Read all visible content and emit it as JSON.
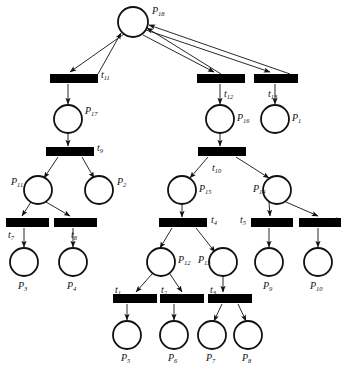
{
  "diagram": {
    "type": "petri-net",
    "title": "",
    "places": [
      {
        "id": "P18",
        "label": "P",
        "sub": "18",
        "cx": 133,
        "cy": 22,
        "r": 15,
        "label_x": 152,
        "label_y": 6
      },
      {
        "id": "P17",
        "label": "P",
        "sub": "17",
        "cx": 68,
        "cy": 119,
        "r": 14,
        "label_x": 85,
        "label_y": 106
      },
      {
        "id": "P16",
        "label": "P",
        "sub": "16",
        "cx": 220,
        "cy": 119,
        "r": 14,
        "label_x": 237,
        "label_y": 113
      },
      {
        "id": "P1",
        "label": "P",
        "sub": "1",
        "cx": 275,
        "cy": 119,
        "r": 14,
        "label_x": 292,
        "label_y": 113
      },
      {
        "id": "P11",
        "label": "P",
        "sub": "11",
        "cx": 38,
        "cy": 190,
        "r": 14,
        "label_x": 11,
        "label_y": 177
      },
      {
        "id": "P2",
        "label": "P",
        "sub": "2",
        "cx": 99,
        "cy": 190,
        "r": 14,
        "label_x": 117,
        "label_y": 177
      },
      {
        "id": "P15",
        "label": "P",
        "sub": "15",
        "cx": 182,
        "cy": 190,
        "r": 14,
        "label_x": 199,
        "label_y": 184
      },
      {
        "id": "P14",
        "label": "P",
        "sub": "14",
        "cx": 277,
        "cy": 190,
        "r": 14,
        "label_x": 253,
        "label_y": 184
      },
      {
        "id": "P3",
        "label": "P",
        "sub": "3",
        "cx": 24,
        "cy": 262,
        "r": 14,
        "label_x": 18,
        "label_y": 281
      },
      {
        "id": "P4",
        "label": "P",
        "sub": "4",
        "cx": 73,
        "cy": 262,
        "r": 14,
        "label_x": 67,
        "label_y": 281
      },
      {
        "id": "P12",
        "label": "P",
        "sub": "12",
        "cx": 161,
        "cy": 262,
        "r": 14,
        "label_x": 178,
        "label_y": 255
      },
      {
        "id": "P13",
        "label": "P",
        "sub": "13",
        "cx": 223,
        "cy": 262,
        "r": 14,
        "label_x": 198,
        "label_y": 255
      },
      {
        "id": "P9",
        "label": "P",
        "sub": "9",
        "cx": 269,
        "cy": 262,
        "r": 14,
        "label_x": 263,
        "label_y": 281
      },
      {
        "id": "P10",
        "label": "P",
        "sub": "10",
        "cx": 318,
        "cy": 262,
        "r": 14,
        "label_x": 310,
        "label_y": 281
      },
      {
        "id": "P5",
        "label": "P",
        "sub": "5",
        "cx": 127,
        "cy": 335,
        "r": 14,
        "label_x": 121,
        "label_y": 353
      },
      {
        "id": "P6",
        "label": "P",
        "sub": "6",
        "cx": 174,
        "cy": 335,
        "r": 14,
        "label_x": 168,
        "label_y": 353
      },
      {
        "id": "P7",
        "label": "P",
        "sub": "7",
        "cx": 212,
        "cy": 335,
        "r": 14,
        "label_x": 206,
        "label_y": 353
      },
      {
        "id": "P8",
        "label": "P",
        "sub": "8",
        "cx": 248,
        "cy": 335,
        "r": 14,
        "label_x": 242,
        "label_y": 353
      }
    ],
    "transitions": [
      {
        "id": "t11",
        "label": "t",
        "sub": "11",
        "x": 50,
        "y": 74,
        "w": 48,
        "h": 9,
        "label_x": 101,
        "label_y": 70
      },
      {
        "id": "t12",
        "label": "t",
        "sub": "12",
        "x": 197,
        "y": 74,
        "w": 48,
        "h": 9,
        "label_x": 224,
        "label_y": 89
      },
      {
        "id": "t13",
        "label": "t",
        "sub": "13",
        "x": 254,
        "y": 74,
        "w": 44,
        "h": 9,
        "label_x": 268,
        "label_y": 89
      },
      {
        "id": "t9",
        "label": "t",
        "sub": "9",
        "x": 46,
        "y": 147,
        "w": 48,
        "h": 9,
        "label_x": 97,
        "label_y": 143
      },
      {
        "id": "t10",
        "label": "t",
        "sub": "10",
        "x": 198,
        "y": 147,
        "w": 48,
        "h": 9,
        "label_x": 212,
        "label_y": 163
      },
      {
        "id": "t7",
        "label": "t",
        "sub": "7",
        "x": 6,
        "y": 218,
        "w": 43,
        "h": 9,
        "label_x": 8,
        "label_y": 230
      },
      {
        "id": "t8",
        "label": "t",
        "sub": "8",
        "x": 54,
        "y": 218,
        "w": 43,
        "h": 9,
        "label_x": 71,
        "label_y": 230
      },
      {
        "id": "t4",
        "label": "t",
        "sub": "4",
        "x": 159,
        "y": 218,
        "w": 48,
        "h": 9,
        "label_x": 211,
        "label_y": 215
      },
      {
        "id": "t5",
        "label": "t",
        "sub": "5",
        "x": 251,
        "y": 218,
        "w": 42,
        "h": 9,
        "label_x": 240,
        "label_y": 215
      },
      {
        "id": "t6",
        "label": "t",
        "sub": "6",
        "x": 299,
        "y": 218,
        "w": 42,
        "h": 9,
        "label_x": 335,
        "label_y": 215
      },
      {
        "id": "t1",
        "label": "t",
        "sub": "1",
        "x": 113,
        "y": 294,
        "w": 44,
        "h": 9,
        "label_x": 115,
        "label_y": 285
      },
      {
        "id": "t2",
        "label": "t",
        "sub": "2",
        "x": 160,
        "y": 294,
        "w": 44,
        "h": 9,
        "label_x": 161,
        "label_y": 285
      },
      {
        "id": "t3",
        "label": "t",
        "sub": "3",
        "x": 208,
        "y": 294,
        "w": 44,
        "h": 9,
        "label_x": 210,
        "label_y": 285
      }
    ],
    "arcs": [
      {
        "from": "t11",
        "to": "P18",
        "x1": 98,
        "y1": 74,
        "x2": 121,
        "y2": 33
      },
      {
        "from": "t12",
        "to": "P18",
        "x1": 221,
        "y1": 74,
        "x2": 147,
        "y2": 28
      },
      {
        "from": "t13",
        "to": "P18",
        "x1": 290,
        "y1": 74,
        "x2": 149,
        "y2": 25
      },
      {
        "from": "P18",
        "to": "t11",
        "x1": 124,
        "y1": 34,
        "x2": 70,
        "y2": 72
      },
      {
        "from": "P18",
        "to": "t12",
        "x1": 143,
        "y1": 35,
        "x2": 214,
        "y2": 72
      },
      {
        "from": "P18",
        "to": "t13",
        "x1": 146,
        "y1": 30,
        "x2": 270,
        "y2": 72
      },
      {
        "from": "t11",
        "to": "P17",
        "x1": 68,
        "y1": 84,
        "x2": 68,
        "y2": 104
      },
      {
        "from": "t12",
        "to": "P16",
        "x1": 220,
        "y1": 84,
        "x2": 220,
        "y2": 104
      },
      {
        "from": "t13",
        "to": "P1",
        "x1": 275,
        "y1": 84,
        "x2": 275,
        "y2": 104
      },
      {
        "from": "P17",
        "to": "t9",
        "x1": 68,
        "y1": 133,
        "x2": 68,
        "y2": 146
      },
      {
        "from": "P16",
        "to": "t10",
        "x1": 220,
        "y1": 133,
        "x2": 220,
        "y2": 146
      },
      {
        "from": "t9",
        "to": "P11",
        "x1": 58,
        "y1": 157,
        "x2": 44,
        "y2": 178
      },
      {
        "from": "t9",
        "to": "P2",
        "x1": 82,
        "y1": 157,
        "x2": 94,
        "y2": 178
      },
      {
        "from": "t10",
        "to": "P15",
        "x1": 208,
        "y1": 157,
        "x2": 190,
        "y2": 178
      },
      {
        "from": "t10",
        "to": "P14",
        "x1": 236,
        "y1": 157,
        "x2": 269,
        "y2": 178
      },
      {
        "from": "P11",
        "to": "t7",
        "x1": 31,
        "y1": 202,
        "x2": 22,
        "y2": 216
      },
      {
        "from": "P11",
        "to": "t8",
        "x1": 46,
        "y1": 202,
        "x2": 70,
        "y2": 216
      },
      {
        "from": "P15",
        "to": "t4",
        "x1": 182,
        "y1": 204,
        "x2": 182,
        "y2": 217
      },
      {
        "from": "P14",
        "to": "t5",
        "x1": 269,
        "y1": 202,
        "x2": 270,
        "y2": 216
      },
      {
        "from": "P14",
        "to": "t6",
        "x1": 286,
        "y1": 202,
        "x2": 318,
        "y2": 216
      },
      {
        "from": "t7",
        "to": "P3",
        "x1": 24,
        "y1": 228,
        "x2": 24,
        "y2": 247
      },
      {
        "from": "t8",
        "to": "P4",
        "x1": 73,
        "y1": 228,
        "x2": 73,
        "y2": 247
      },
      {
        "from": "t5",
        "to": "P9",
        "x1": 269,
        "y1": 228,
        "x2": 269,
        "y2": 247
      },
      {
        "from": "t6",
        "to": "P10",
        "x1": 318,
        "y1": 228,
        "x2": 318,
        "y2": 247
      },
      {
        "from": "t4",
        "to": "P12",
        "x1": 172,
        "y1": 228,
        "x2": 160,
        "y2": 248
      },
      {
        "from": "t4",
        "to": "P13",
        "x1": 196,
        "y1": 228,
        "x2": 215,
        "y2": 252
      },
      {
        "from": "P12",
        "to": "t1",
        "x1": 152,
        "y1": 274,
        "x2": 136,
        "y2": 292
      },
      {
        "from": "P12",
        "to": "t2",
        "x1": 170,
        "y1": 274,
        "x2": 182,
        "y2": 292
      },
      {
        "from": "P13",
        "to": "t3",
        "x1": 223,
        "y1": 276,
        "x2": 223,
        "y2": 292
      },
      {
        "from": "t1",
        "to": "P5",
        "x1": 127,
        "y1": 304,
        "x2": 127,
        "y2": 320
      },
      {
        "from": "t2",
        "to": "P6",
        "x1": 174,
        "y1": 304,
        "x2": 174,
        "y2": 320
      },
      {
        "from": "t3",
        "to": "P7",
        "x1": 222,
        "y1": 304,
        "x2": 214,
        "y2": 321
      },
      {
        "from": "t3",
        "to": "P8",
        "x1": 238,
        "y1": 304,
        "x2": 246,
        "y2": 321
      }
    ],
    "colors": {
      "stroke": "#111111",
      "fill": "#ffffff",
      "transition": "#000000"
    }
  }
}
